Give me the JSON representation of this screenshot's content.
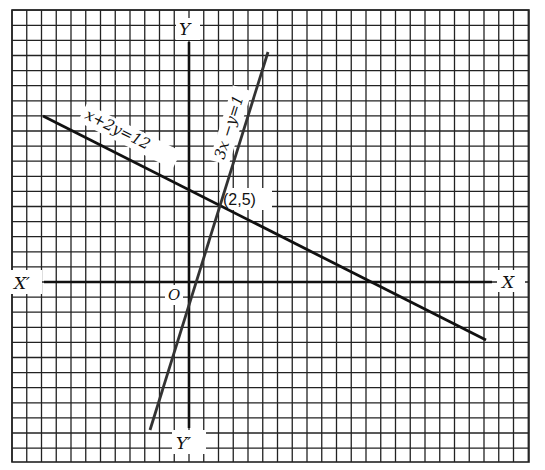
{
  "diagram": {
    "type": "coordinate-graph",
    "grid": {
      "x_min": -12,
      "x_max": 23,
      "y_min": -12,
      "y_max": 18,
      "color": "#222222"
    },
    "axes": {
      "x_positive_label": "X",
      "x_negative_label": "X′",
      "y_positive_label": "Y",
      "y_negative_label": "Y′",
      "origin_label": "O"
    },
    "lines": [
      {
        "equation": "x+2y=12",
        "label": "x+2y=12",
        "from": [
          -10,
          11
        ],
        "to": [
          20.3,
          -3.9
        ]
      },
      {
        "equation": "3x−y=1",
        "label": "3x −y=1",
        "from": [
          -2.7,
          -10
        ],
        "to": [
          5.4,
          15.5
        ]
      }
    ],
    "intersection": {
      "point": [
        2,
        5
      ],
      "label": "(2,5)"
    }
  }
}
